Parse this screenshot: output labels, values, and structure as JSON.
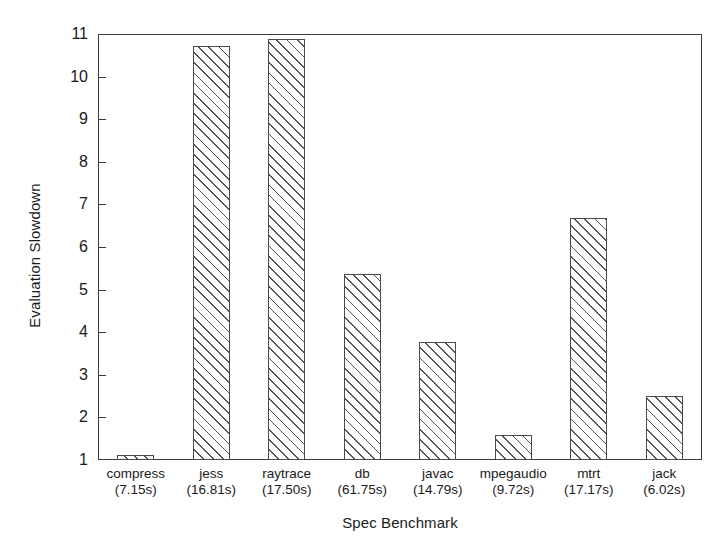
{
  "chart_data": {
    "type": "bar",
    "title": "",
    "xlabel": "Spec Benchmark",
    "ylabel": "Evaluation Slowdown",
    "categories": [
      "compress",
      "jess",
      "raytrace",
      "db",
      "javac",
      "mpegaudio",
      "mtrt",
      "jack"
    ],
    "category_sublabels": [
      "(7.15s)",
      "(16.81s)",
      "(17.50s)",
      "(61.75s)",
      "(14.79s)",
      "(9.72s)",
      "(17.17s)",
      "(6.02s)"
    ],
    "values": [
      1.12,
      10.72,
      10.88,
      5.37,
      3.77,
      1.59,
      6.68,
      2.5
    ],
    "ylim": [
      1,
      11
    ],
    "yticks": [
      1,
      2,
      3,
      4,
      5,
      6,
      7,
      8,
      9,
      10,
      11
    ],
    "ytick_labels": [
      "1",
      "2",
      "3",
      "4",
      "5",
      "6",
      "7",
      "8",
      "9",
      "10",
      "11"
    ],
    "grid": false,
    "legend": false,
    "bar_fill": "hatched-diagonal",
    "bar_edge_color": "#4a4a4a",
    "frame_color": "#3a3a3a",
    "background": "#ffffff"
  }
}
